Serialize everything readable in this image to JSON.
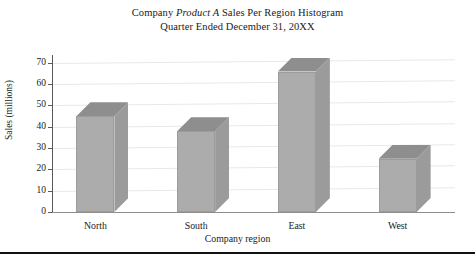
{
  "chart_data": {
    "type": "bar",
    "title": "Company Product A Sales Per Region Histogram",
    "title_line1_pre": "Company ",
    "title_line1_em": "Product A",
    "title_line1_post": " Sales Per Region Histogram",
    "title_line2": "Quarter Ended December 31, 20XX",
    "subtitle": "Quarter Ended December 31, 20XX",
    "xlabel": "Company region",
    "ylabel": "Sales (millions)",
    "categories": [
      "North",
      "South",
      "East",
      "West"
    ],
    "values": [
      45,
      38,
      66,
      25
    ],
    "ylim": [
      0,
      70
    ],
    "ytick_values": [
      70,
      60,
      50,
      40,
      30,
      20,
      10,
      0
    ],
    "ytick_labels": [
      "70",
      "60",
      "50",
      "40",
      "30",
      "20",
      "10",
      "0"
    ],
    "grid": true,
    "legend": "none",
    "style": "3d-bar",
    "bar_face_color": "#acacac",
    "bar_top_color": "#8e8e8e",
    "bar_side_color": "#9b9b9b",
    "gridline_color": "#e8e8ea",
    "axis_color": "#5a5a5a",
    "background_color": "#ffffff",
    "text_color": "#1a1a1a"
  },
  "figure": {
    "bottom_rule_color": "#111111"
  }
}
